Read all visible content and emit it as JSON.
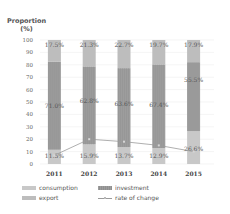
{
  "chart_data": {
    "type": "bar",
    "stacked": true,
    "title": "",
    "ylabel": "Proportion (%)",
    "ylabel_lines": [
      "Proportion",
      "(%)"
    ],
    "xlabel": "",
    "ylim": [
      0,
      100
    ],
    "yticks": [
      0,
      10,
      20,
      30,
      40,
      50,
      60,
      70,
      80,
      90,
      100
    ],
    "grid": true,
    "legend_position": "bottom",
    "categories": [
      "2011",
      "2012",
      "2013",
      "2014",
      "2015"
    ],
    "series": [
      {
        "name": "consumption",
        "kind": "bar",
        "color": "#c8c8c8",
        "values": [
          11.5,
          15.9,
          13.7,
          12.9,
          26.6
        ],
        "labels": [
          "11.5%",
          "15.9%",
          "13.7%",
          "12.9%",
          "26.6%"
        ]
      },
      {
        "name": "investment",
        "kind": "bar",
        "color": "#9d9d9d",
        "values": [
          71.0,
          62.8,
          63.6,
          67.4,
          55.5
        ],
        "labels": [
          "71.0%",
          "62.8%",
          "63.6%",
          "67.4%",
          "55.5%"
        ]
      },
      {
        "name": "export",
        "kind": "bar",
        "color": "#bdbdbd",
        "values": [
          17.5,
          21.3,
          22.7,
          19.7,
          17.9
        ],
        "labels": [
          "17.5%",
          "21.3%",
          "22.7%",
          "19.7%",
          "17.9%"
        ]
      },
      {
        "name": "rate of change",
        "kind": "line",
        "color": "#9a9a9a",
        "values": [
          7,
          20,
          18,
          15,
          10
        ]
      }
    ]
  },
  "legend": {
    "consumption": "consumption",
    "investment": "investment",
    "export": "export",
    "rate_of_change": "rate of change"
  }
}
